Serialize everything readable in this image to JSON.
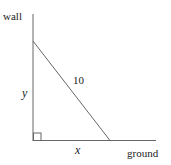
{
  "diagram": {
    "labels": {
      "wall": "wall",
      "ground": "ground",
      "hypotenuse": "10",
      "vertical": "y",
      "horizontal": "x"
    },
    "colors": {
      "line": "#555555",
      "text": "#222222"
    }
  }
}
